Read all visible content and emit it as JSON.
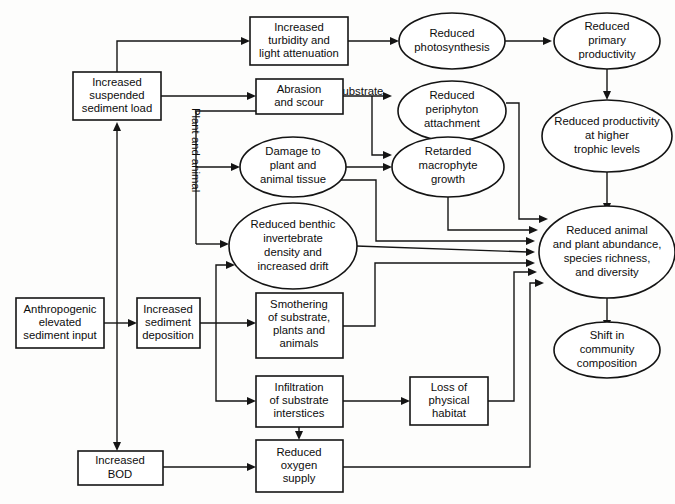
{
  "diagram": {
    "background_color": "#fdfdfc",
    "line_color": "#141414",
    "text_color": "#0d0d0d",
    "nodes": [
      {
        "id": "turbidity",
        "shape": "box",
        "lines": [
          "Increased",
          "turbidity and",
          "light attenuation"
        ]
      },
      {
        "id": "suspended",
        "shape": "box",
        "lines": [
          "Increased",
          "suspended",
          "sediment load"
        ]
      },
      {
        "id": "abrasion",
        "shape": "box",
        "lines": [
          "Abrasion",
          "and scour"
        ]
      },
      {
        "id": "photosynthesis",
        "shape": "ellipse",
        "lines": [
          "Reduced",
          "photosynthesis"
        ]
      },
      {
        "id": "primaryprod",
        "shape": "ellipse",
        "lines": [
          "Reduced",
          "primary",
          "productivity"
        ]
      },
      {
        "id": "periphyton",
        "shape": "ellipse",
        "lines": [
          "Reduced",
          "periphyton",
          "attachment"
        ]
      },
      {
        "id": "trophic",
        "shape": "ellipse",
        "lines": [
          "Reduced productivity",
          "at higher",
          "trophic levels"
        ]
      },
      {
        "id": "damage",
        "shape": "ellipse",
        "lines": [
          "Damage to",
          "plant and",
          "animal tissue"
        ]
      },
      {
        "id": "macrophyte",
        "shape": "ellipse",
        "lines": [
          "Retarded",
          "macrophyte",
          "growth"
        ]
      },
      {
        "id": "benthic",
        "shape": "ellipse",
        "lines": [
          "Reduced benthic",
          "invertebrate",
          "density and",
          "increased drift"
        ]
      },
      {
        "id": "abundance",
        "shape": "ellipse",
        "lines": [
          "Reduced animal",
          "and plant abundance,",
          "species richness,",
          "and diversity"
        ]
      },
      {
        "id": "anthropogenic",
        "shape": "box",
        "lines": [
          "Anthropogenic",
          "elevated",
          "sediment input"
        ]
      },
      {
        "id": "deposition",
        "shape": "box",
        "lines": [
          "Increased",
          "sediment",
          "deposition"
        ]
      },
      {
        "id": "smothering",
        "shape": "box",
        "lines": [
          "Smothering",
          "of substrate,",
          "plants and",
          "animals"
        ]
      },
      {
        "id": "shift",
        "shape": "ellipse",
        "lines": [
          "Shift in",
          "community",
          "composition"
        ]
      },
      {
        "id": "infiltration",
        "shape": "box",
        "lines": [
          "Infiltration",
          "of substrate",
          "interstices"
        ]
      },
      {
        "id": "habitat",
        "shape": "box",
        "lines": [
          "Loss of",
          "physical",
          "habitat"
        ]
      },
      {
        "id": "bod",
        "shape": "box",
        "lines": [
          "Increased",
          "BOD"
        ]
      },
      {
        "id": "oxygen",
        "shape": "box",
        "lines": [
          "Reduced",
          "oxygen",
          "supply"
        ]
      }
    ],
    "edge_labels": [
      {
        "id": "substrate-label",
        "text": "Substrate",
        "orientation": "horizontal"
      },
      {
        "id": "plant-and-animal-label",
        "text": "Plant and animal",
        "orientation": "vertical"
      }
    ],
    "edges": [
      {
        "from": "anthropogenic",
        "to": "deposition"
      },
      {
        "from": "anthropogenic",
        "to": "suspended"
      },
      {
        "from": "anthropogenic",
        "to": "bod"
      },
      {
        "from": "suspended",
        "to": "turbidity"
      },
      {
        "from": "suspended",
        "to": "abrasion"
      },
      {
        "from": "abrasion",
        "to": "damage",
        "label": "Plant and animal"
      },
      {
        "from": "abrasion",
        "to": "benthic",
        "label": "Plant and animal"
      },
      {
        "from": "abrasion",
        "to": "periphyton",
        "label": "Substrate"
      },
      {
        "from": "abrasion",
        "to": "macrophyte",
        "label": "Substrate"
      },
      {
        "from": "turbidity",
        "to": "photosynthesis"
      },
      {
        "from": "photosynthesis",
        "to": "primaryprod"
      },
      {
        "from": "primaryprod",
        "to": "trophic"
      },
      {
        "from": "trophic",
        "to": "abundance"
      },
      {
        "from": "periphyton",
        "to": "abundance"
      },
      {
        "from": "macrophyte",
        "to": "abundance"
      },
      {
        "from": "damage",
        "to": "macrophyte"
      },
      {
        "from": "damage",
        "to": "abundance"
      },
      {
        "from": "benthic",
        "to": "abundance"
      },
      {
        "from": "deposition",
        "to": "benthic"
      },
      {
        "from": "deposition",
        "to": "smothering"
      },
      {
        "from": "deposition",
        "to": "infiltration"
      },
      {
        "from": "smothering",
        "to": "abundance"
      },
      {
        "from": "infiltration",
        "to": "habitat"
      },
      {
        "from": "infiltration",
        "to": "oxygen"
      },
      {
        "from": "habitat",
        "to": "abundance"
      },
      {
        "from": "bod",
        "to": "oxygen"
      },
      {
        "from": "oxygen",
        "to": "abundance"
      },
      {
        "from": "abundance",
        "to": "shift"
      }
    ]
  }
}
